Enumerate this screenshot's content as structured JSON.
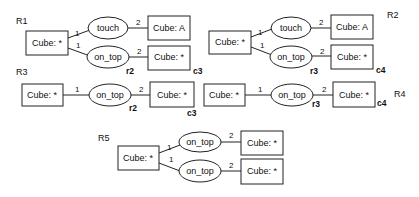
{
  "diagram": {
    "rules": [
      {
        "id": "R1",
        "label": "R1",
        "nodes": {
          "root": "Cube: *",
          "rel1": "touch",
          "obj1": "Cube: A",
          "rel2": "on_top",
          "obj2": "Cube: *"
        },
        "edges": {
          "e1": "1",
          "e2": "2",
          "e3": "1",
          "e4": "2"
        },
        "tags": {
          "rel2": "r2",
          "obj2": "c3"
        }
      },
      {
        "id": "R2",
        "label": "R2",
        "nodes": {
          "root": "Cube: *",
          "rel1": "touch",
          "obj1": "Cube: A",
          "rel2": "on_top",
          "obj2": "Cube: *"
        },
        "edges": {
          "e1": "1",
          "e2": "2",
          "e3": "1",
          "e4": "2"
        },
        "tags": {
          "rel2": "r3",
          "obj2": "c4"
        }
      },
      {
        "id": "R3",
        "label": "R3",
        "nodes": {
          "root": "Cube: *",
          "rel1": "on_top",
          "obj1": "Cube: *"
        },
        "edges": {
          "e1": "1",
          "e2": "2"
        },
        "tags": {
          "rel1": "r2",
          "obj1": "c3"
        }
      },
      {
        "id": "R4",
        "label": "R4",
        "nodes": {
          "root": "Cube: *",
          "rel1": "on_top",
          "obj1": "Cube: *"
        },
        "edges": {
          "e1": "1",
          "e2": "2"
        },
        "tags": {
          "rel1": "r3",
          "obj1": "c4"
        }
      },
      {
        "id": "R5",
        "label": "R5",
        "nodes": {
          "root": "Cube: *",
          "rel1": "on_top",
          "obj1": "Cube: *",
          "rel2": "on_top",
          "obj2": "Cube: *"
        },
        "edges": {
          "e1": "1",
          "e2": "2",
          "e3": "1",
          "e4": "2"
        },
        "tags": {}
      }
    ]
  }
}
